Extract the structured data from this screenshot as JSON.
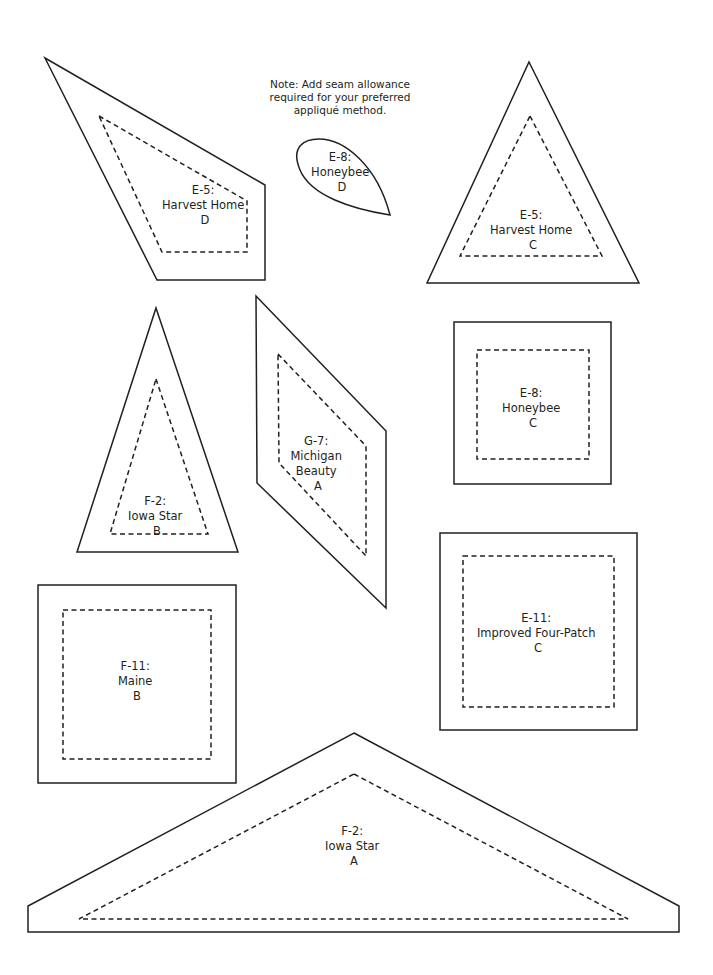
{
  "page": {
    "background_color": "#ffffff",
    "ink_color": "#231f20",
    "width": 713,
    "height": 975
  },
  "note": {
    "name": "seam-allowance-note",
    "line1": "Note: Add seam allowance",
    "line2": "required for your preferred",
    "line3": "appliqué method."
  },
  "pieces": [
    {
      "id": "harvest-home-d",
      "code": "E-5:",
      "name": "Harvest Home",
      "letter": "D",
      "shape": "quadrilateral",
      "label_x": 205,
      "label_y": 190,
      "cut_points": "45,58 265,185 265,280 157,280",
      "seam_points": "99,116 247,201 247,252 162,252"
    },
    {
      "id": "harvest-home-c",
      "code": "E-5:",
      "name": "Harvest Home",
      "letter": "C",
      "shape": "triangle",
      "label_x": 533,
      "label_y": 222,
      "cut_points": "529,62 639,283 427,283",
      "seam_points": "530,116 602,256 460,256"
    },
    {
      "id": "honeybee-d",
      "code": "E-8:",
      "name": "Honeybee",
      "letter": "D",
      "shape": "teardrop",
      "label_x": 342,
      "label_y": 171,
      "cut_path": "M 390,215 C 352,209 311,196 300,170 C 290,146 305,139 319,139 C 344,139 377,165 390,215 Z"
    },
    {
      "id": "iowa-star-b",
      "code": "F-2:",
      "name": "Iowa Star",
      "letter": "B",
      "shape": "triangle",
      "label_x": 157,
      "label_y": 508,
      "cut_points": "156,308 238,552 77,552",
      "seam_points": "156,379 208,534 110,534"
    },
    {
      "id": "michigan-beauty-a",
      "code": "G-7:",
      "name": "Michigan Beauty",
      "letter": "A",
      "shape": "parallelogram",
      "label_x": 318,
      "label_y": 455,
      "cut_points": "256,296 386,431 386,608 257,483",
      "seam_points": "278,354 366,446 366,556 279,463"
    },
    {
      "id": "honeybee-c",
      "code": "E-8:",
      "name": "Honeybee",
      "letter": "C",
      "shape": "square",
      "label_x": 533,
      "label_y": 407,
      "cut_points": "454,322 611,322 611,484 454,484",
      "seam_points": "477,350 589,350 589,459 477,459"
    },
    {
      "id": "maine-b",
      "code": "F-11:",
      "name": "Maine",
      "letter": "B",
      "shape": "square",
      "label_x": 137,
      "label_y": 680,
      "cut_points": "38,585 236,585 236,783 38,783"
    },
    {
      "id": "improved-four-patch-c",
      "code": "E-11:",
      "name": "Improved Four-Patch",
      "letter": "C",
      "shape": "square",
      "label_x": 538,
      "label_y": 632,
      "cut_points": "440,533 637,533 637,730 440,730",
      "seam_points": "463,556 614,556 614,707 463,707"
    },
    {
      "id": "iowa-star-a",
      "code": "F-2:",
      "name": "Iowa Star",
      "letter": "A",
      "shape": "pentagon",
      "label_x": 354,
      "label_y": 842,
      "cut_points": "354,733 679,906 679,932 28,932 28,906",
      "seam_points": "354,774 628,919 79,919"
    }
  ],
  "seam_outlines": {
    "maine_b": "63,610 211,610 211,759 63,759"
  }
}
